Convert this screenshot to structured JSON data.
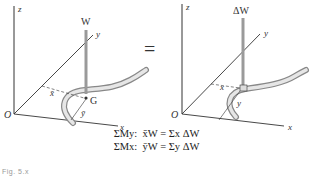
{
  "figure": {
    "left_panel": {
      "axis_labels": {
        "z": "z",
        "y": "y",
        "x": "x",
        "origin": "O"
      },
      "force_label": "W",
      "centroid_label": "G",
      "dim_x_label": "x̄",
      "dim_y_label": "ȳ"
    },
    "equals_sign": "=",
    "right_panel": {
      "axis_labels": {
        "z": "z",
        "y": "y",
        "x": "x",
        "origin": "O"
      },
      "force_label": "ΔW",
      "dim_x_label": "x",
      "dim_y_label": "y"
    },
    "equations": [
      {
        "lhs": "ΣMy:",
        "rhs": "x̄W = Σx ΔW"
      },
      {
        "lhs": "ΣMx:",
        "rhs": "ȳW = Σy ΔW"
      }
    ],
    "caption": "Fig. 5.x"
  },
  "colors": {
    "axis": "#222222",
    "force_arrow": "#9a9a9a",
    "rod": "#bdbdbd"
  }
}
